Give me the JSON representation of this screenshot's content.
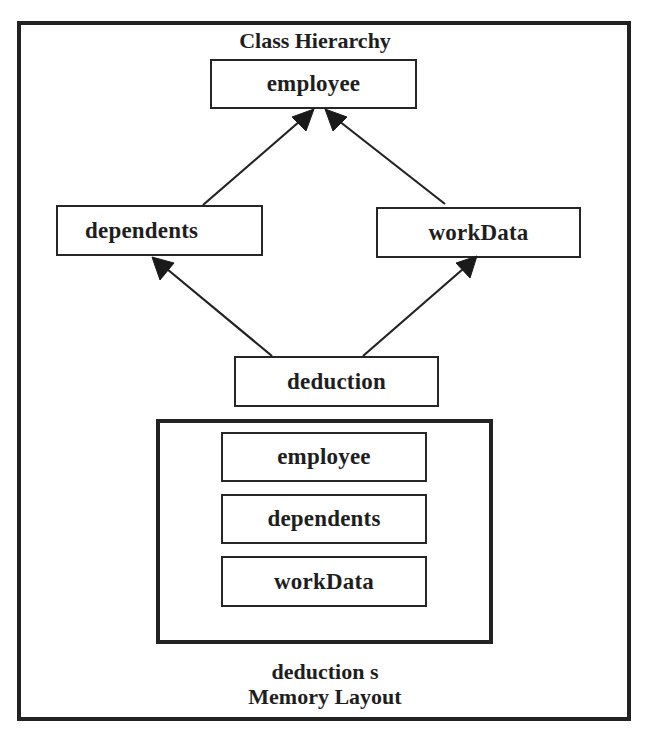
{
  "diagram": {
    "hierarchy_title": "Class Hierarchy",
    "classes": {
      "employee": "employee",
      "dependents": "dependents",
      "workData": "workData",
      "deduction": "deduction"
    },
    "edges": [
      {
        "from": "dependents",
        "to": "employee",
        "type": "inheritance"
      },
      {
        "from": "workData",
        "to": "employee",
        "type": "inheritance"
      },
      {
        "from": "deduction",
        "to": "dependents",
        "type": "inheritance"
      },
      {
        "from": "deduction",
        "to": "workData",
        "type": "inheritance"
      }
    ],
    "memory_layout": {
      "parts": [
        "employee",
        "dependents",
        "workData"
      ],
      "caption_line1": "deduction s",
      "caption_line2": "Memory Layout"
    },
    "colors": {
      "line": "#222222",
      "background": "#ffffff"
    }
  }
}
